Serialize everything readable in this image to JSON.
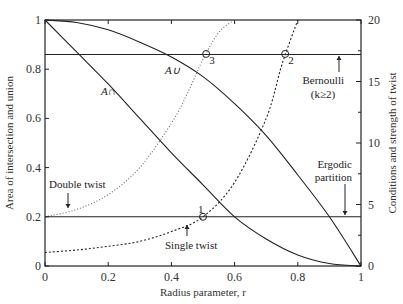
{
  "chart_data": {
    "type": "line",
    "title": "",
    "xlabel": "Radius parameter, r",
    "ylabel_left": "Area of intersection and union",
    "ylabel_right": "Conditions and strength of twist",
    "xlim": [
      0,
      1
    ],
    "ylim_left": [
      0,
      1
    ],
    "ylim_right": [
      0,
      20
    ],
    "x_ticks": [
      "0",
      "0.2",
      "0.4",
      "0.6",
      "0.8",
      "1"
    ],
    "y_left_ticks": [
      "0",
      "0.2",
      "0.4",
      "0.6",
      "0.8",
      "1"
    ],
    "y_right_ticks": [
      "0",
      "5",
      "10",
      "15",
      "20"
    ],
    "grid": false,
    "series": [
      {
        "name": "A∪ (area of union)",
        "axis": "left",
        "style": "solid",
        "x": [
          0,
          0.1,
          0.2,
          0.3,
          0.4,
          0.5,
          0.6,
          0.7,
          0.8,
          0.9,
          1.0
        ],
        "y": [
          1.0,
          0.99,
          0.96,
          0.91,
          0.85,
          0.77,
          0.66,
          0.53,
          0.37,
          0.2,
          0.0
        ]
      },
      {
        "name": "A∩ (area of intersection)",
        "axis": "left",
        "style": "solid",
        "x": [
          0,
          0.1,
          0.2,
          0.3,
          0.4,
          0.5,
          0.6,
          0.7,
          0.8,
          0.9,
          1.0
        ],
        "y": [
          1.0,
          0.87,
          0.74,
          0.6,
          0.46,
          0.33,
          0.2,
          0.11,
          0.045,
          0.01,
          0.0
        ]
      },
      {
        "name": "Double twist",
        "axis": "left",
        "style": "dotted",
        "x": [
          0,
          0.1,
          0.2,
          0.3,
          0.4,
          0.45,
          0.5,
          0.55,
          0.6
        ],
        "y": [
          0.2,
          0.23,
          0.29,
          0.4,
          0.58,
          0.7,
          0.84,
          0.95,
          1.0
        ]
      },
      {
        "name": "Single twist",
        "axis": "left",
        "style": "dashed",
        "x": [
          0,
          0.1,
          0.2,
          0.3,
          0.4,
          0.5,
          0.6,
          0.7,
          0.75,
          0.8
        ],
        "y": [
          0.055,
          0.065,
          0.08,
          0.1,
          0.14,
          0.2,
          0.34,
          0.6,
          0.82,
          1.0
        ]
      },
      {
        "name": "Bernoulli (k≥2)",
        "axis": "right",
        "style": "solid-horizontal",
        "x": [
          0,
          1
        ],
        "y": [
          17.2,
          17.2
        ]
      },
      {
        "name": "Ergodic partition",
        "axis": "right",
        "style": "solid-horizontal",
        "x": [
          0,
          1
        ],
        "y": [
          4,
          4
        ]
      }
    ],
    "markers": [
      {
        "label": "1",
        "x": 0.5,
        "y_left": 0.2
      },
      {
        "label": "2",
        "x": 0.76,
        "y_left": 0.862
      },
      {
        "label": "3",
        "x": 0.51,
        "y_left": 0.862
      }
    ],
    "annotations": {
      "a_union": "A∪",
      "a_intersection": "A∩",
      "bernoulli": "Bernoulli",
      "bernoulli_k": "(k≥2)",
      "ergodic_1": "Ergodic",
      "ergodic_2": "partition",
      "double_twist": "Double twist",
      "single_twist": "Single twist"
    }
  }
}
